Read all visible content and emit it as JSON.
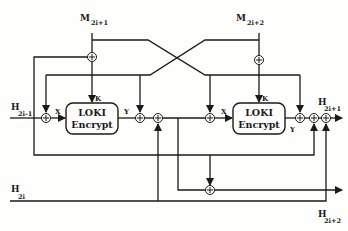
{
  "diagram": {
    "type": "block-diagram",
    "title": "",
    "inputs": {
      "m_left": {
        "base": "M",
        "sub": "2i+1"
      },
      "m_right": {
        "base": "M",
        "sub": "2i+2"
      },
      "h_prev": {
        "base": "H",
        "sub": "2i-1"
      },
      "h_even": {
        "base": "H",
        "sub": "2i"
      }
    },
    "outputs": {
      "h_out1": {
        "base": "H",
        "sub": "2i+1"
      },
      "h_out2": {
        "base": "H",
        "sub": "2i+2"
      }
    },
    "blocks": [
      {
        "id": "loki-left",
        "line1": "LOKI",
        "line2": "Encrypt",
        "port_in": "X",
        "port_key": "K",
        "port_out": "Y"
      },
      {
        "id": "loki-right",
        "line1": "LOKI",
        "line2": "Encrypt",
        "port_in": "X",
        "port_key": "K",
        "port_out": "Y"
      }
    ],
    "xor_symbol": "⊕",
    "colors": {
      "line": "#1a1a1a",
      "background": "#fefefc"
    }
  }
}
